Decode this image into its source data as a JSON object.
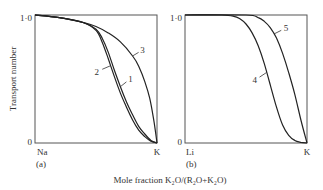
{
  "chart_data": [
    {
      "type": "line",
      "panel_label": "(a)",
      "ylabel": "Transport number",
      "xlabel": "Mole fraction K2O/(R2O+K2O)",
      "x_tick_labels": [
        "Na",
        "K"
      ],
      "y_tick_labels": [
        "0",
        "1·0"
      ],
      "xlim": [
        0,
        1
      ],
      "ylim": [
        0,
        1
      ],
      "grid": false,
      "series": [
        {
          "name": "1",
          "x": [
            0,
            0.2,
            0.4,
            0.5,
            0.55,
            0.6,
            0.65,
            0.7,
            0.75,
            0.8,
            0.85,
            0.9,
            0.95,
            1.0
          ],
          "y": [
            1.0,
            0.98,
            0.94,
            0.89,
            0.82,
            0.71,
            0.57,
            0.44,
            0.32,
            0.22,
            0.13,
            0.07,
            0.02,
            0.0
          ]
        },
        {
          "name": "2",
          "x": [
            0,
            0.2,
            0.4,
            0.5,
            0.55,
            0.6,
            0.65,
            0.7,
            0.75,
            0.8,
            0.85,
            0.9,
            0.95,
            1.0
          ],
          "y": [
            1.0,
            0.98,
            0.94,
            0.88,
            0.79,
            0.66,
            0.52,
            0.39,
            0.28,
            0.18,
            0.1,
            0.05,
            0.015,
            0.0
          ]
        },
        {
          "name": "3",
          "x": [
            0,
            0.2,
            0.4,
            0.5,
            0.6,
            0.7,
            0.8,
            0.85,
            0.9,
            0.94,
            0.97,
            0.99,
            1.0
          ],
          "y": [
            1.0,
            0.98,
            0.94,
            0.91,
            0.86,
            0.79,
            0.68,
            0.6,
            0.48,
            0.35,
            0.2,
            0.07,
            0.0
          ]
        }
      ]
    },
    {
      "type": "line",
      "panel_label": "(b)",
      "ylabel": "",
      "xlabel": "Mole fraction K2O/(R2O+K2O)",
      "x_tick_labels": [
        "Li",
        "K"
      ],
      "y_tick_labels": [
        "0",
        "1·0"
      ],
      "xlim": [
        0,
        1
      ],
      "ylim": [
        0,
        1
      ],
      "grid": false,
      "series": [
        {
          "name": "4",
          "x": [
            0,
            0.3,
            0.4,
            0.45,
            0.5,
            0.55,
            0.6,
            0.65,
            0.7,
            0.75,
            0.8,
            0.85,
            0.9,
            0.95,
            1.0
          ],
          "y": [
            1.0,
            1.0,
            0.99,
            0.97,
            0.93,
            0.86,
            0.76,
            0.62,
            0.45,
            0.28,
            0.14,
            0.06,
            0.02,
            0.005,
            0.0
          ]
        },
        {
          "name": "5",
          "x": [
            0,
            0.5,
            0.6,
            0.65,
            0.7,
            0.75,
            0.8,
            0.85,
            0.9,
            0.95,
            1.0
          ],
          "y": [
            1.0,
            1.0,
            0.98,
            0.95,
            0.9,
            0.82,
            0.7,
            0.55,
            0.38,
            0.18,
            0.0
          ]
        }
      ]
    }
  ],
  "caption": "Mole fraction K₂O/(R₂O+K₂O)"
}
